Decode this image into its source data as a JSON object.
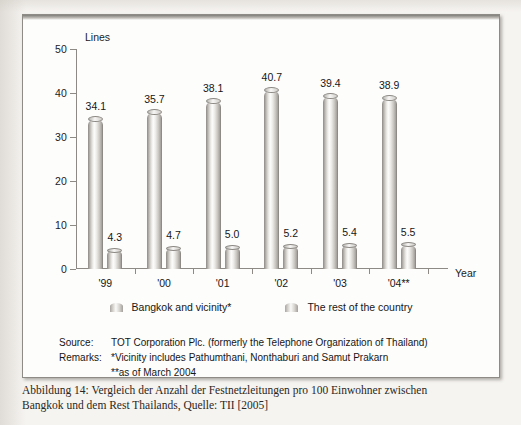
{
  "figure": {
    "axis_title_y": "Lines",
    "axis_title_x": "Year",
    "y_ticks": [
      "0",
      "10",
      "20",
      "30",
      "40",
      "50"
    ],
    "legend": [
      {
        "label": "Bangkok and vicinity*",
        "swatch": "cylinder-swatch-light"
      },
      {
        "label": "The rest of the country",
        "swatch": "cylinder-swatch-light"
      }
    ],
    "notes": {
      "source_key": "Source:",
      "source_value": "TOT Corporation Plc. (formerly the Telephone Organization of Thailand)",
      "remarks_key": "Remarks:",
      "remarks_line1": "*Vicinity includes Pathumthani, Nonthaburi and Samut Prakarn",
      "remarks_line2": "**as of March 2004"
    }
  },
  "caption": {
    "line1": "Abbildung 14: Vergleich der Anzahl der Festnetzleitungen pro 100 Einwohner zwischen",
    "line2": "Bangkok und dem Rest Thailands, Quelle: TII [2005]"
  },
  "chart_data": {
    "type": "bar",
    "title": "",
    "xlabel": "Year",
    "ylabel": "Lines",
    "ylim": [
      0,
      50
    ],
    "yticks": [
      0,
      10,
      20,
      30,
      40,
      50
    ],
    "grid": false,
    "legend_position": "bottom",
    "categories": [
      "'99",
      "'00",
      "'01",
      "'02",
      "'03",
      "'04**"
    ],
    "series": [
      {
        "name": "Bangkok and vicinity*",
        "values": [
          34.1,
          35.7,
          38.1,
          40.7,
          39.4,
          38.9
        ],
        "labels": [
          "34.1",
          "35.7",
          "38.1",
          "40.7",
          "39.4",
          "38.9"
        ]
      },
      {
        "name": "The rest of the country",
        "values": [
          4.3,
          4.7,
          5.0,
          5.2,
          5.4,
          5.5
        ],
        "labels": [
          "4.3",
          "4.7",
          "5.0",
          "5.2",
          "5.4",
          "5.5"
        ]
      }
    ]
  },
  "colors": {
    "paper": "#f6f4f1",
    "frame_border": "#8e8b86",
    "axis": "#8d8a85",
    "text": "#161616",
    "bar_light": "#fbfbfa",
    "bar_dark": "#7e7b76"
  }
}
